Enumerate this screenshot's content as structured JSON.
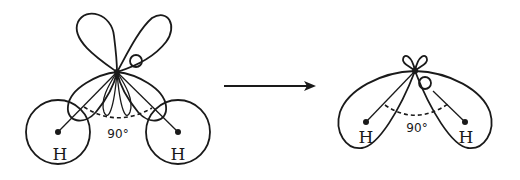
{
  "diagram": {
    "type": "molecular-orbital-schematic",
    "left_molecule": {
      "atoms": [
        {
          "symbol": "O",
          "role": "central"
        },
        {
          "symbol": "H",
          "role": "left"
        },
        {
          "symbol": "H",
          "role": "right"
        }
      ],
      "oxygen_label": "O",
      "hydrogen_labels": [
        "H",
        "H"
      ],
      "angle_label": "90°",
      "description": "Oxygen p-orbital lobes overlapping spherical hydrogen 1s orbitals"
    },
    "arrow": {
      "direction": "right"
    },
    "right_molecule": {
      "oxygen_label": "O",
      "hydrogen_labels": [
        "H",
        "H"
      ],
      "angle_label": "90°",
      "description": "Merged bonding orbitals enveloping both hydrogens"
    }
  }
}
